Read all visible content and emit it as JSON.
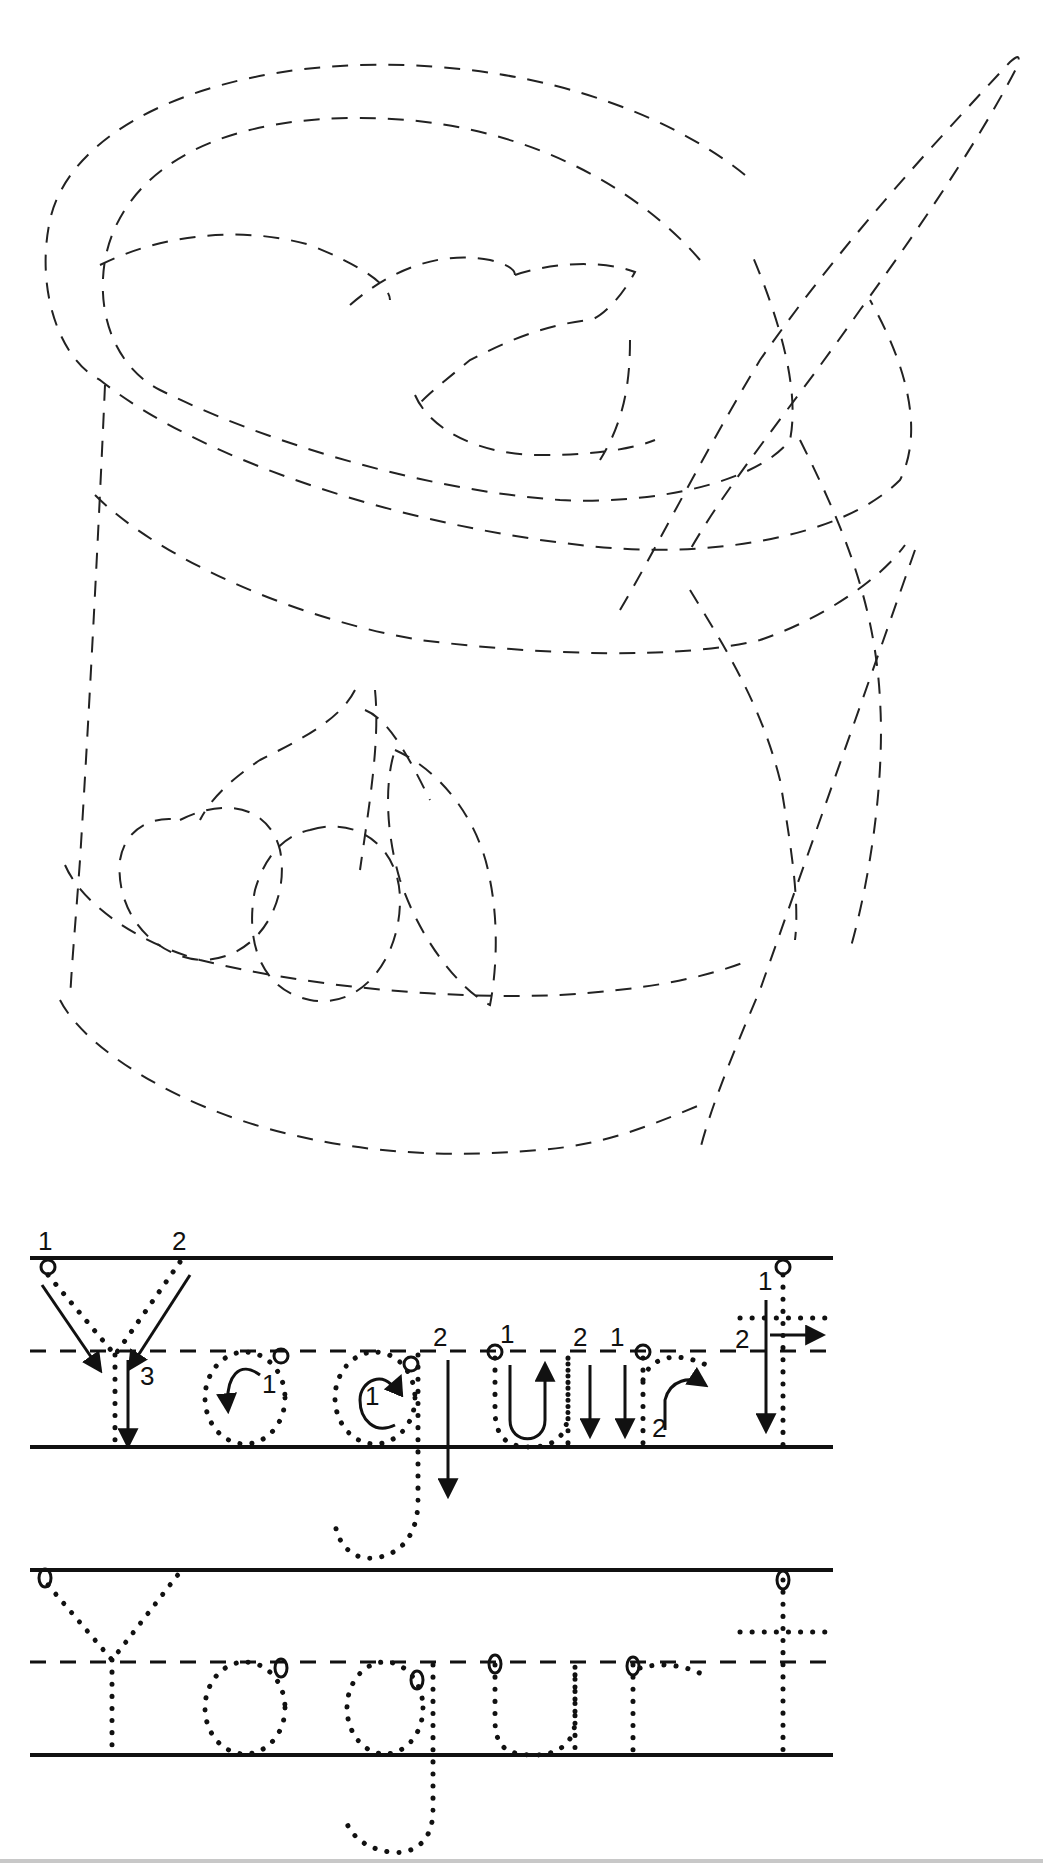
{
  "worksheet": {
    "word": "Yogurt",
    "illustration": "yogurt-cup-with-spoon-and-cherries",
    "colors": {
      "ink": "#111111",
      "background": "#ffffff"
    },
    "guided_row": {
      "letters": [
        "Y",
        "o",
        "g",
        "u",
        "r",
        "t"
      ],
      "stroke_numbers": {
        "Y": [
          "1",
          "2",
          "3"
        ],
        "o": [
          "1"
        ],
        "g": [
          "1",
          "2"
        ],
        "u": [
          "1",
          "2"
        ],
        "r": [
          "1",
          "2"
        ],
        "t": [
          "1",
          "2"
        ]
      }
    },
    "practice_row": {
      "letters": [
        "Y",
        "o",
        "g",
        "u",
        "r",
        "t"
      ]
    }
  }
}
